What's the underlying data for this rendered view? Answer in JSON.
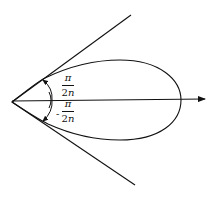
{
  "diagram": {
    "type": "polar-lobe-with-tangent-lines",
    "stroke_color": "#111111",
    "background": "#ffffff",
    "origin": {
      "x": 12,
      "y": 102
    },
    "axis": {
      "x1": 12,
      "y1": 101,
      "x2": 205,
      "y2": 99,
      "arrow": true
    },
    "upper_line": {
      "x2": 131,
      "y2": 15
    },
    "lower_line": {
      "x2": 135,
      "y2": 185
    },
    "lobe": {
      "right_extent_x": 181,
      "top_y": 60,
      "bottom_y": 140
    },
    "labels": {
      "upper_angle": {
        "numerator": "π",
        "denominator_number": "2",
        "denominator_var": "n",
        "sign": ""
      },
      "lower_angle": {
        "numerator": "π",
        "denominator_number": "2",
        "denominator_var": "n",
        "sign": "-"
      }
    }
  }
}
